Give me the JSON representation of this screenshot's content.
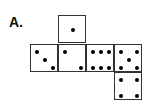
{
  "label": "A.",
  "faces": [
    {
      "name": "top",
      "value": 1,
      "x": 58,
      "y": 15,
      "dots": [
        [
          14,
          14
        ]
      ]
    },
    {
      "name": "left",
      "value": 3,
      "x": 30,
      "y": 44,
      "dots": [
        [
          6,
          7
        ],
        [
          14,
          15
        ],
        [
          22,
          23
        ]
      ]
    },
    {
      "name": "center",
      "value": 2,
      "x": 58,
      "y": 44,
      "dots": [
        [
          6,
          7
        ],
        [
          22,
          23
        ]
      ]
    },
    {
      "name": "right",
      "value": 6,
      "x": 86,
      "y": 44,
      "dots": [
        [
          6,
          7
        ],
        [
          14,
          7
        ],
        [
          22,
          7
        ],
        [
          6,
          23
        ],
        [
          14,
          23
        ],
        [
          22,
          23
        ]
      ]
    },
    {
      "name": "far-right",
      "value": 5,
      "x": 114,
      "y": 44,
      "dots": [
        [
          6,
          7
        ],
        [
          22,
          7
        ],
        [
          14,
          15
        ],
        [
          6,
          23
        ],
        [
          22,
          23
        ]
      ]
    },
    {
      "name": "bottom",
      "value": 4,
      "x": 114,
      "y": 72,
      "dots": [
        [
          6,
          7
        ],
        [
          22,
          7
        ],
        [
          6,
          23
        ],
        [
          22,
          23
        ]
      ]
    }
  ]
}
